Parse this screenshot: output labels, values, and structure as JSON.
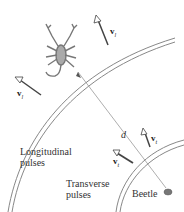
{
  "figure": {
    "labels": {
      "longitudinal": "Longitudinal",
      "longitudinal2": "pulses",
      "transverse": "Transverse",
      "transverse2": "pulses",
      "beetle": "Beetle",
      "distance": "d"
    },
    "vectors": {
      "vl": {
        "symbol": "v",
        "subscript": "l"
      },
      "vt": {
        "symbol": "v",
        "subscript": "t"
      }
    },
    "colors": {
      "line": "#555555",
      "text": "#333333",
      "scorpion": "#777777"
    }
  }
}
